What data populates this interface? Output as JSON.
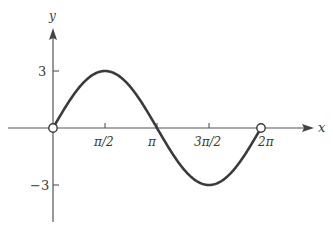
{
  "chart_data": {
    "type": "line",
    "title": "",
    "function": "y = 3 sin x",
    "xlabel": "x",
    "ylabel": "y",
    "x_domain": [
      0,
      6.283185307
    ],
    "xlim": [
      -0.72,
      7.8
    ],
    "ylim": [
      -4.9,
      5.2
    ],
    "grid": false,
    "legend": null,
    "x_ticks": [
      {
        "value": 1.5707963,
        "label": "π/2"
      },
      {
        "value": 3.1415927,
        "label": "π"
      },
      {
        "value": 4.712389,
        "label": "3π/2"
      },
      {
        "value": 6.2831853,
        "label": "2π"
      }
    ],
    "y_ticks": [
      {
        "value": 3,
        "label": "3"
      },
      {
        "value": -3,
        "label": "−3"
      }
    ],
    "open_endpoints": [
      {
        "x": 0,
        "y": 0
      },
      {
        "x": 6.2831853,
        "y": 0
      }
    ],
    "sample_points": [
      {
        "x": 0,
        "y": 0
      },
      {
        "x": 0.785,
        "y": 2.12
      },
      {
        "x": 1.571,
        "y": 3
      },
      {
        "x": 2.356,
        "y": 2.12
      },
      {
        "x": 3.142,
        "y": 0
      },
      {
        "x": 3.927,
        "y": -2.12
      },
      {
        "x": 4.712,
        "y": -3
      },
      {
        "x": 5.498,
        "y": -2.12
      },
      {
        "x": 6.283,
        "y": 0
      }
    ],
    "colors": {
      "curve": "#3a3a3a",
      "axes": "#555555",
      "background": "#ffffff"
    }
  },
  "labels": {
    "x_axis": "x",
    "y_axis": "y",
    "tick_pi_half": "π/2",
    "tick_pi": "π",
    "tick_three_pi_half": "3π/2",
    "tick_two_pi": "2π",
    "tick_three": "3",
    "tick_neg_three": "−3"
  }
}
